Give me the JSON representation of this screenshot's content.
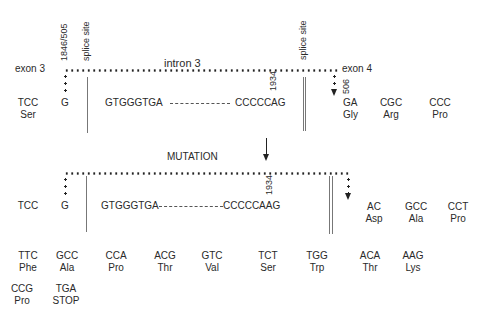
{
  "normal": {
    "exon3_label": "exon 3",
    "exon4_label": "exon 4",
    "intron_label": "intron 3",
    "pos_left": "1846/505",
    "splice_left": "splice site",
    "splice_right": "splice site",
    "pos_1934": "1934",
    "pos_506": "506",
    "seq_start": "GTGGGTGA",
    "seq_end": "CCCCCAG",
    "codons": [
      {
        "codon": "TCC",
        "aa": "Ser"
      },
      {
        "codon": "G",
        "aa": ""
      },
      {
        "codon": "GA",
        "aa": "Gly"
      },
      {
        "codon": "CGC",
        "aa": "Arg"
      },
      {
        "codon": "CCC",
        "aa": "Pro"
      }
    ]
  },
  "mutation_label": "MUTATION",
  "mutant": {
    "pos_1934": "1934",
    "seq_start": "GTGGGTGA",
    "seq_end": "CCCCCAAG",
    "codons": [
      {
        "codon": "TCC",
        "aa": ""
      },
      {
        "codon": "G",
        "aa": ""
      },
      {
        "codon": "AC",
        "aa": "Asp"
      },
      {
        "codon": "GCC",
        "aa": "Ala"
      },
      {
        "codon": "CCT",
        "aa": "Pro"
      }
    ],
    "readthrough_row1": [
      {
        "codon": "TTC",
        "aa": "Phe"
      },
      {
        "codon": "GCC",
        "aa": "Ala"
      },
      {
        "codon": "CCA",
        "aa": "Pro"
      },
      {
        "codon": "ACG",
        "aa": "Thr"
      },
      {
        "codon": "GTC",
        "aa": "Val"
      },
      {
        "codon": "TCT",
        "aa": "Ser"
      },
      {
        "codon": "TGG",
        "aa": "Trp"
      },
      {
        "codon": "ACA",
        "aa": "Thr"
      },
      {
        "codon": "AAG",
        "aa": "Lys"
      }
    ],
    "readthrough_row2": [
      {
        "codon": "CCG",
        "aa": "Pro"
      },
      {
        "codon": "TGA",
        "aa": "STOP"
      }
    ]
  }
}
